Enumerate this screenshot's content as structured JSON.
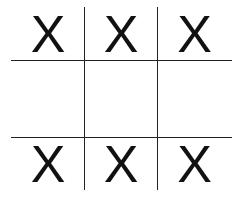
{
  "game": "tic-tac-toe",
  "board": [
    [
      "X",
      "X",
      "X"
    ],
    [
      "",
      "",
      ""
    ],
    [
      "X",
      "X",
      "X"
    ]
  ],
  "colors": {
    "mark": "#111111",
    "grid": "#222222",
    "background": "#ffffff"
  }
}
